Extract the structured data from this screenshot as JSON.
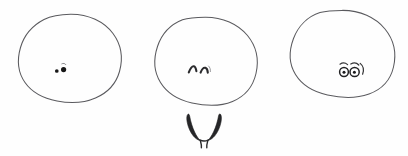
{
  "image": {
    "title": "Three hand-drawn blob faces with a pair of horns",
    "width": 408,
    "height": 156,
    "background_color": "#fefefe",
    "outline_color": "#5a5a5e",
    "ink_color": "#262628",
    "style": "pencil line drawing, sketch",
    "caption": "Three egg-shaped outlines each with a small simple face drawn low on the body, and a separate pair of curved horns beneath the middle shape."
  },
  "figures": [
    {
      "name": "blob-left",
      "label": "Blob 1",
      "face_type": "two-solid-dots",
      "face_description": "two small solid black dots with a faint tick mark above",
      "expression": "neutral / beady eyes"
    },
    {
      "name": "blob-center",
      "label": "Blob 2",
      "face_type": "two-arches",
      "face_description": "two caret-shaped arches like closed smiling eyes",
      "expression": "content / eyes closed"
    },
    {
      "name": "blob-right",
      "label": "Blob 3",
      "face_type": "two-rings-with-pupils",
      "face_description": "two outlined round eyes each with a dark pupil and a curved brow above",
      "expression": "surprised / wide awake"
    }
  ],
  "horns": {
    "name": "horns-pair",
    "label": "Horns",
    "description": "a symmetrical pair of tapering curved horns meeting at the base with two small legs",
    "count": 2
  }
}
